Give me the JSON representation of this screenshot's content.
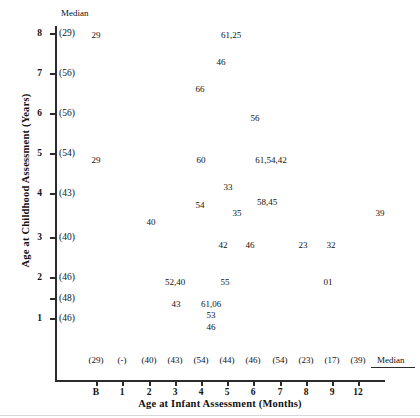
{
  "chart_data": {
    "type": "scatter",
    "title": "",
    "xlabel": "Age at Infant Assessment (Months)",
    "ylabel": "Age at Childhood Assessment (Years)",
    "grid": false,
    "legend": null,
    "median_label_top": "Median",
    "median_label_right": "Median",
    "x_categories": [
      "B",
      "1",
      "2",
      "3",
      "4",
      "5",
      "6",
      "7",
      "8",
      "9",
      "12"
    ],
    "x_medians": [
      "(29)",
      "(-)",
      "(40)",
      "(43)",
      "(54)",
      "(44)",
      "(46)",
      "(54)",
      "(23)",
      "(17)",
      "(39)"
    ],
    "y_categories": [
      "8",
      "7",
      "6",
      "5",
      "4",
      "3",
      "2",
      "",
      "1"
    ],
    "y_medians": [
      "(29)",
      "(56)",
      "(56)",
      "(54)",
      "(43)",
      "(40)",
      "(46)",
      "(48)",
      "(46)"
    ],
    "points": [
      {
        "x": "B",
        "y": "8",
        "label": "29"
      },
      {
        "x": "5",
        "y": "8",
        "label": "61,25"
      },
      {
        "x": "4",
        "y": "7.6",
        "label": "46"
      },
      {
        "x": "3",
        "y": "6.9",
        "label": "66"
      },
      {
        "x": "6",
        "y": "6.3",
        "label": "56"
      },
      {
        "x": "B",
        "y": "5",
        "label": "29"
      },
      {
        "x": "4",
        "y": "5",
        "label": "60"
      },
      {
        "x": "6",
        "y": "5",
        "label": "61,54,42"
      },
      {
        "x": "5",
        "y": "4.6",
        "label": "33"
      },
      {
        "x": "4",
        "y": "4",
        "label": "54"
      },
      {
        "x": "6",
        "y": "4",
        "label": "58,45"
      },
      {
        "x": "2",
        "y": "3.6",
        "label": "40"
      },
      {
        "x": "5",
        "y": "3.7",
        "label": "35"
      },
      {
        "x": "12",
        "y": "3.7",
        "label": "39"
      },
      {
        "x": "5",
        "y": "3",
        "label": "42"
      },
      {
        "x": "6",
        "y": "3",
        "label": "46"
      },
      {
        "x": "8",
        "y": "3",
        "label": "23"
      },
      {
        "x": "9",
        "y": "3",
        "label": "32"
      },
      {
        "x": "3",
        "y": "2",
        "label": "52,40"
      },
      {
        "x": "5",
        "y": "2",
        "label": "55"
      },
      {
        "x": "9",
        "y": "2",
        "label": "01"
      },
      {
        "x": "3",
        "y": "1.5",
        "label": "43"
      },
      {
        "x": "4",
        "y": "1.5",
        "label": "61,06"
      },
      {
        "x": "4",
        "y": "1.25",
        "label": "53"
      },
      {
        "x": "4",
        "y": "1",
        "label": "46"
      }
    ]
  },
  "geometry": {
    "y_ticks_px": [
      33,
      73,
      113,
      153,
      193,
      237,
      277,
      298,
      318
    ],
    "x_ticks_px": [
      96,
      122,
      149,
      175,
      201,
      227,
      253,
      280,
      306,
      332,
      358
    ],
    "point_positions": [
      {
        "px": 96,
        "py": 30
      },
      {
        "px": 231,
        "py": 30
      },
      {
        "px": 221,
        "py": 57
      },
      {
        "px": 200,
        "py": 84
      },
      {
        "px": 255,
        "py": 113
      },
      {
        "px": 96,
        "py": 155
      },
      {
        "px": 201,
        "py": 155
      },
      {
        "px": 271,
        "py": 155
      },
      {
        "px": 228,
        "py": 182
      },
      {
        "px": 200,
        "py": 200
      },
      {
        "px": 267,
        "py": 197
      },
      {
        "px": 151,
        "py": 217
      },
      {
        "px": 237,
        "py": 208
      },
      {
        "px": 380,
        "py": 208
      },
      {
        "px": 223,
        "py": 240
      },
      {
        "px": 250,
        "py": 240
      },
      {
        "px": 303,
        "py": 240
      },
      {
        "px": 331,
        "py": 240
      },
      {
        "px": 175,
        "py": 277
      },
      {
        "px": 225,
        "py": 277
      },
      {
        "px": 328,
        "py": 277
      },
      {
        "px": 176,
        "py": 299
      },
      {
        "px": 211,
        "py": 299
      },
      {
        "px": 211,
        "py": 310
      },
      {
        "px": 211,
        "py": 322
      }
    ]
  }
}
